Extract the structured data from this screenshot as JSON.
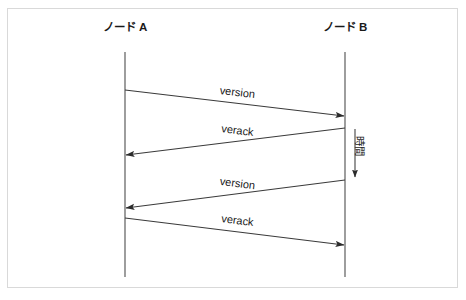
{
  "diagram": {
    "title_visible": false,
    "background_color": "#ffffff",
    "frame_color": "#d9d9d9",
    "line_color": "#3a3a3a",
    "lifeline_color": "#4d4d4d",
    "text_color": "#1a1a1a",
    "lifelines": [
      {
        "id": "node-a",
        "label": "ノード A",
        "x": 125,
        "label_x": 125,
        "label_y": 31,
        "top": 52,
        "bottom": 277
      },
      {
        "id": "node-b",
        "label": "ノード B",
        "x": 345,
        "label_x": 345,
        "label_y": 31,
        "top": 52,
        "bottom": 277
      }
    ],
    "messages": [
      {
        "id": "msg-1",
        "label": "version",
        "from": "node-a",
        "to": "node-b",
        "x1": 125,
        "y1": 90,
        "x2": 345,
        "y2": 116,
        "label_x": 237,
        "label_y": 96,
        "angle": 6.7
      },
      {
        "id": "msg-2",
        "label": "verack",
        "from": "node-b",
        "to": "node-a",
        "x1": 345,
        "y1": 128,
        "x2": 125,
        "y2": 155,
        "label_x": 237,
        "label_y": 134,
        "angle": 7.0
      },
      {
        "id": "msg-3",
        "label": "version",
        "from": "node-b",
        "to": "node-a",
        "x1": 345,
        "y1": 180,
        "x2": 125,
        "y2": 208,
        "label_x": 237,
        "label_y": 187,
        "angle": 7.2
      },
      {
        "id": "msg-4",
        "label": "verack",
        "from": "node-a",
        "to": "node-b",
        "x1": 125,
        "y1": 218,
        "x2": 345,
        "y2": 245,
        "label_x": 237,
        "label_y": 224,
        "angle": 7.0
      }
    ],
    "time_axis": {
      "label": "時間",
      "label_x": 356,
      "label_y": 136,
      "arrow_x": 355,
      "arrow_y_start": 128,
      "arrow_y_end": 178,
      "direction": "down"
    }
  }
}
